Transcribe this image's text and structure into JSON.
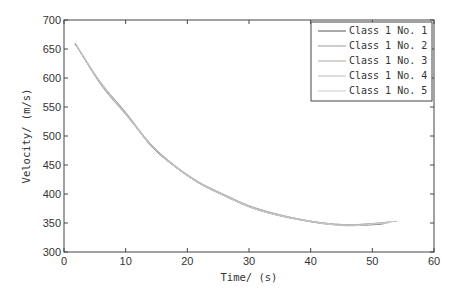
{
  "chart_data": {
    "type": "line",
    "title": "",
    "xlabel": "Time/ (s)",
    "ylabel": "Velocity/ (m/s)",
    "xlim": [
      0,
      60
    ],
    "ylim": [
      300,
      700
    ],
    "xticks": [
      0,
      10,
      20,
      30,
      40,
      50,
      60
    ],
    "yticks": [
      300,
      350,
      400,
      450,
      500,
      550,
      600,
      650,
      700
    ],
    "grid": false,
    "legend_position": "upper right",
    "series": [
      {
        "name": "Class 1 No.1",
        "color": "#555555",
        "x": [
          1.8,
          6,
          10,
          14,
          18,
          22,
          26,
          30,
          34,
          38,
          42,
          46,
          50,
          52
        ],
        "y": [
          659,
          590,
          540,
          484,
          447,
          418,
          397,
          378,
          365,
          356,
          349,
          346,
          347,
          349
        ]
      },
      {
        "name": "Class 1 No.2",
        "color": "#999999",
        "x": [
          2,
          6,
          10,
          14,
          18,
          22,
          26,
          30,
          34,
          38,
          42,
          46,
          50,
          53
        ],
        "y": [
          657,
          588,
          537,
          486,
          448,
          419,
          398,
          379,
          366,
          357,
          350,
          347,
          349,
          352
        ]
      },
      {
        "name": "Class 1 No.3",
        "color": "#aaaaaa",
        "x": [
          1.8,
          6,
          10,
          14,
          18,
          22,
          26,
          30,
          34,
          38,
          42,
          46,
          50,
          52.5
        ],
        "y": [
          660,
          592,
          541,
          487,
          449,
          420,
          399,
          380,
          367,
          357,
          350,
          346,
          348,
          350
        ]
      },
      {
        "name": "Class 1 No.4",
        "color": "#bbbbbb",
        "x": [
          2,
          6,
          10,
          14,
          18,
          22,
          26,
          30,
          34,
          38,
          42,
          46,
          50,
          54
        ],
        "y": [
          656,
          589,
          539,
          485,
          448,
          419,
          398,
          379,
          366,
          357,
          350,
          347,
          349,
          353
        ]
      },
      {
        "name": "Class 1 No.5",
        "color": "#cccccc",
        "x": [
          2,
          6,
          10,
          14,
          18,
          22,
          26,
          30,
          34,
          38,
          42,
          46,
          50,
          53
        ],
        "y": [
          658,
          591,
          538,
          485,
          447,
          418,
          397,
          378,
          365,
          356,
          349,
          345,
          348,
          351
        ]
      }
    ]
  }
}
